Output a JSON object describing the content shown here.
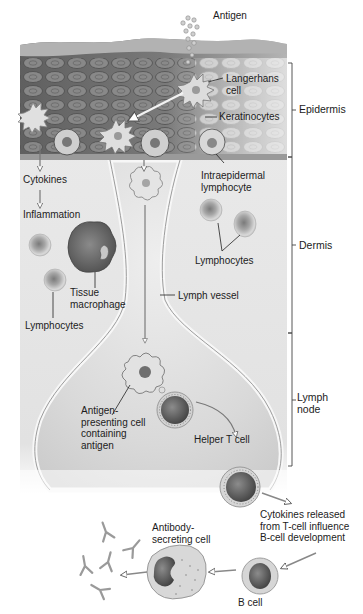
{
  "figure": {
    "type": "biological-illustration"
  },
  "regions": {
    "epidermis": "Epidermis",
    "dermis": "Dermis",
    "lymph_node": "Lymph\nnode"
  },
  "labels": {
    "antigen": "Antigen",
    "langerhans_cell": "Langerhans\ncell",
    "keratinocytes": "Keratinocytes",
    "cytokines": "Cytokines",
    "inflammation": "Inflammation",
    "intraepidermal_lymphocyte": "Intraepidermal\nlymphocyte",
    "lymphocytes_right": "Lymphocytes",
    "tissue_macrophage": "Tissue\nmacrophage",
    "lymphocytes_left": "Lymphocytes",
    "lymph_vessel": "Lymph vessel",
    "antigen_presenting_cell": "Antigen-\npresenting cell\ncontaining\nantigen",
    "helper_t_cell": "Helper T cell",
    "cytokines_released": "Cytokines released\nfrom T-cell influence\nB-cell development",
    "antibody_secreting_cell": "Antibody-\nsecreting cell",
    "b_cell": "B cell"
  },
  "colors": {
    "background": "#ffffff",
    "epidermis_dark": "#6e6e6e",
    "epidermis_light": "#b9b9b9",
    "dermis": "#e6e6e6",
    "lymph_node": "#dedede",
    "stroke": "#3a3a3a",
    "text": "#1c1c1c"
  }
}
